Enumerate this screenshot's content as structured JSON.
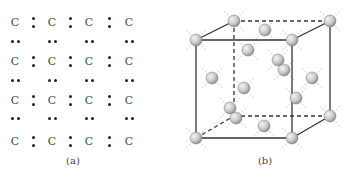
{
  "figure": {
    "panel_a": {
      "caption": "(a)",
      "atom_symbol": "C",
      "columns_x": [
        15,
        52,
        89,
        129
      ],
      "rows_y": [
        22,
        61,
        100,
        141
      ],
      "pair_rows_y": [
        41,
        80,
        118
      ]
    },
    "panel_b": {
      "caption": "(b)",
      "description": "Diamond cubic unit cell with atoms at corners, face centers and interior tetrahedral sites"
    }
  }
}
